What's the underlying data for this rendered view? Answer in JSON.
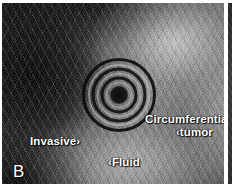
{
  "figure": {
    "panel_letter": "B",
    "modality": "endoscopic-ultrasound",
    "annotations": [
      {
        "id": "invasive",
        "text": "Invasive",
        "marker": "›",
        "marker_side": "right"
      },
      {
        "id": "tumor",
        "line1": "Circumferential",
        "line2_marker": "‹",
        "line2": "tumor"
      },
      {
        "id": "fluid",
        "marker": "‹",
        "text": "Fluid",
        "marker_side": "left"
      }
    ],
    "features": {
      "ring_artifact_label": "transducer-ring-artifact",
      "ring_count": 5
    },
    "colors": {
      "label_text": "#ffffff",
      "background": "#ffffff",
      "image_dark": "#1d1d1d",
      "image_light": "#d7d7d7"
    }
  }
}
